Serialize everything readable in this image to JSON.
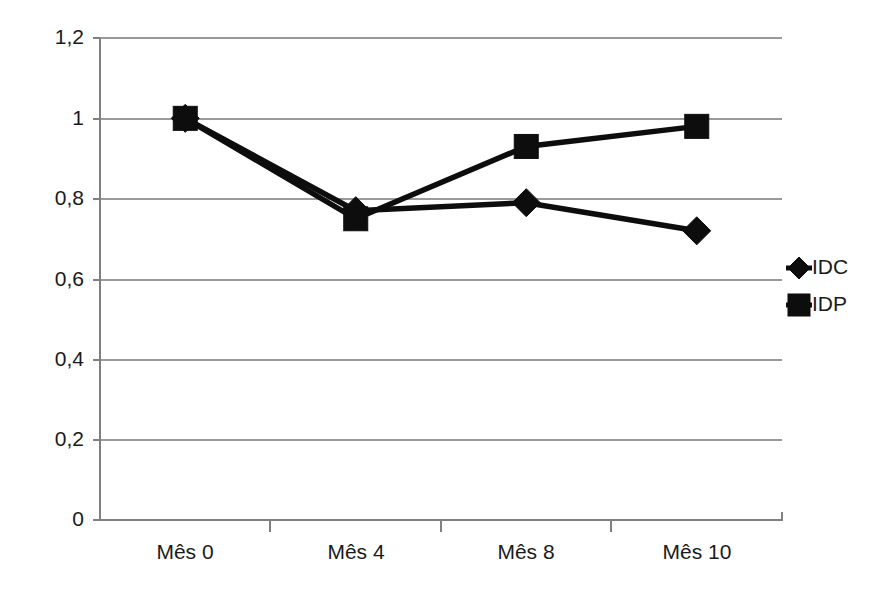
{
  "chart_data": {
    "type": "line",
    "title": "",
    "subtitle": "",
    "xlabel": "",
    "ylabel": "",
    "categories": [
      "Mês 0",
      "Mês 4",
      "Mês 8",
      "Mês 10"
    ],
    "series": [
      {
        "name": "IDC",
        "marker": "diamond",
        "color": "#0d0d0d",
        "values": [
          1.0,
          0.77,
          0.79,
          0.72
        ]
      },
      {
        "name": "IDP",
        "marker": "square",
        "color": "#0d0d0d",
        "values": [
          1.0,
          0.75,
          0.93,
          0.98
        ]
      }
    ],
    "ylim": [
      0,
      1.2
    ],
    "yticks": [
      0,
      0.2,
      0.4,
      0.6,
      0.8,
      1.0,
      1.2
    ],
    "ytick_labels": [
      "0",
      "0,2",
      "0,4",
      "0,6",
      "0,8",
      "1",
      "1,2"
    ],
    "grid": "horizontal",
    "legend_position": "right",
    "decimal_separator": ",",
    "background_color": "#ffffff",
    "gridline_color": "#9a9a9a",
    "axis_color": "#808080"
  },
  "axis": {
    "y_labels": [
      "1,2",
      "1",
      "0,8",
      "0,6",
      "0,4",
      "0,2",
      "0"
    ],
    "x_labels": [
      "Mês 0",
      "Mês 4",
      "Mês 8",
      "Mês 10"
    ]
  },
  "legend": {
    "items": [
      {
        "label": "IDC",
        "marker": "diamond"
      },
      {
        "label": "IDP",
        "marker": "square"
      }
    ]
  }
}
